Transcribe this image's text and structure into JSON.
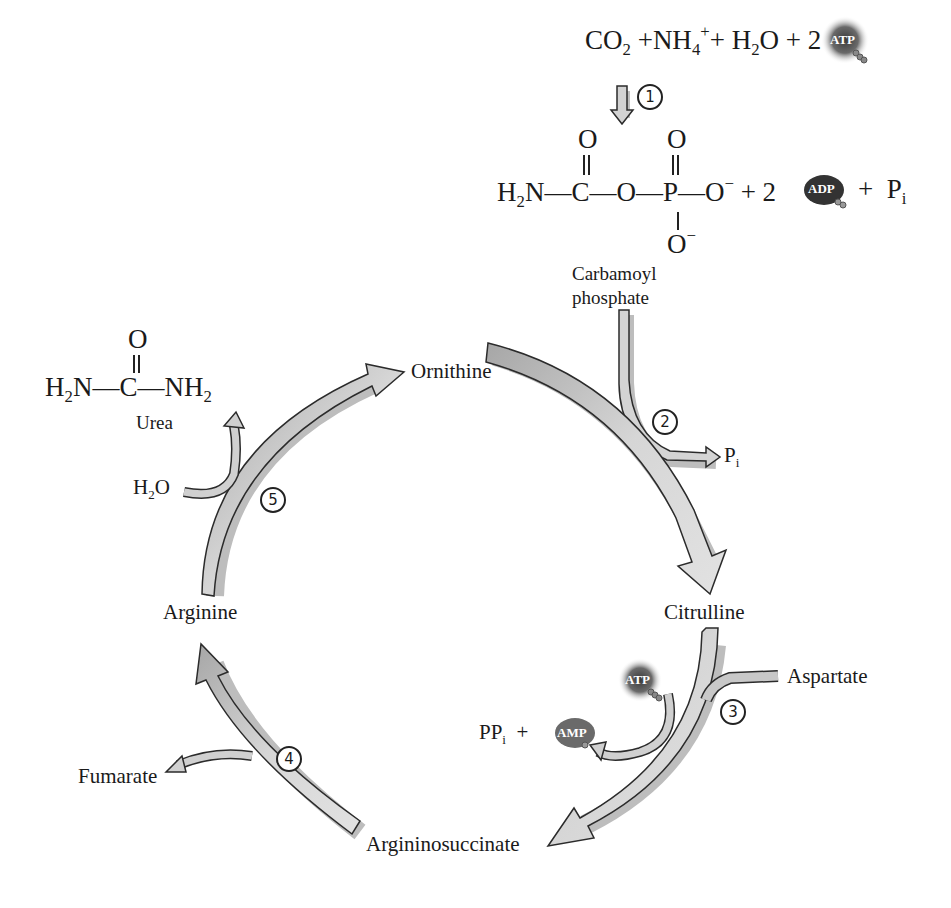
{
  "figure": {
    "colors": {
      "arrow_fill": "#cfcfcf",
      "arrow_fill_dark": "#a9a9a9",
      "arrow_outline": "#2b2b2b",
      "shadow": "#bdbdbd",
      "atp_badge": "#4a4a4a",
      "adp_badge": "#3a3a3a",
      "amp_badge": "#6e6e6e"
    }
  },
  "reaction_1": {
    "step": "1",
    "reactants": {
      "co2": "CO",
      "co2_sub": "2",
      "plus1": "+",
      "nh4": "NH",
      "nh4_sub": "4",
      "nh4_sup": "+",
      "plus2": "+",
      "h2o": "H",
      "h2o_sub": "2",
      "h2o_o": "O",
      "plus3": "+",
      "coef": "2",
      "atp": "ATP"
    },
    "product": {
      "h2n": "H",
      "h2n_sub": "2",
      "h2n_n": "N",
      "c": "C",
      "o_top_c": "O",
      "o_bridge": "O",
      "p": "P",
      "o_top_p": "O",
      "o_right": "O",
      "o_right_sup": "−",
      "o_bottom": "O",
      "o_bottom_sup": "−",
      "plus1": "+",
      "coef": "2",
      "adp": "ADP",
      "plus2": "+",
      "pi": "P",
      "pi_sub": "i"
    },
    "product_name_line1": "Carbamoyl",
    "product_name_line2": "phosphate"
  },
  "cycle": {
    "intermediates": {
      "ornithine": "Ornithine",
      "citrulline": "Citrulline",
      "argininosuccinate": "Argininosuccinate",
      "arginine": "Arginine"
    },
    "steps": [
      "2",
      "3",
      "4",
      "5"
    ],
    "step2": {
      "byproduct": "P",
      "byproduct_sub": "i"
    },
    "step3": {
      "input": "Aspartate",
      "atp": "ATP",
      "ppi": "PP",
      "ppi_sub": "i",
      "plus": "+",
      "amp": "AMP"
    },
    "step4": {
      "output": "Fumarate"
    },
    "step5": {
      "input_h": "H",
      "input_sub": "2",
      "input_o": "O",
      "urea": {
        "o_top": "O",
        "left": "H",
        "left_sub": "2",
        "left_n": "N",
        "c": "C",
        "right": "NH",
        "right_sub": "2",
        "name": "Urea"
      }
    }
  }
}
